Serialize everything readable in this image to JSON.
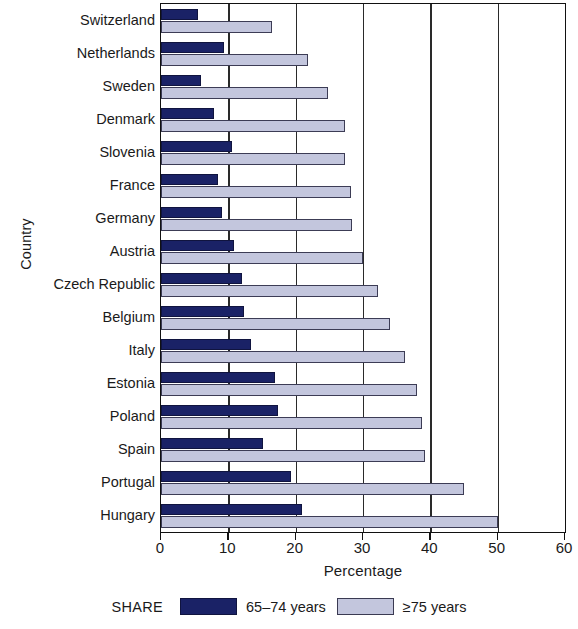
{
  "chart_data": {
    "type": "bar",
    "orientation": "horizontal",
    "title": "",
    "xlabel": "Percentage",
    "ylabel": "Country",
    "xlim": [
      0,
      60
    ],
    "xticks": [
      0,
      10,
      20,
      30,
      40,
      50,
      60
    ],
    "grid": "vertical",
    "legend_position": "bottom",
    "legend_prefix": "SHARE",
    "categories": [
      "Switzerland",
      "Netherlands",
      "Sweden",
      "Denmark",
      "Slovenia",
      "France",
      "Germany",
      "Austria",
      "Czech Republic",
      "Belgium",
      "Italy",
      "Estonia",
      "Poland",
      "Spain",
      "Portugal",
      "Hungary"
    ],
    "series": [
      {
        "name": "65–74 years",
        "color": "#1a2266",
        "values": [
          5.5,
          9.3,
          6.0,
          7.8,
          10.5,
          8.4,
          9.0,
          10.8,
          12.0,
          12.4,
          13.3,
          17.0,
          17.4,
          15.2,
          19.3,
          21.0
        ]
      },
      {
        "name": "≥75 years",
        "color": "#c3c6dd",
        "values": [
          16.5,
          21.8,
          24.8,
          27.4,
          27.3,
          28.2,
          28.3,
          30.0,
          32.3,
          34.0,
          36.3,
          38.0,
          38.8,
          39.2,
          45.0,
          50.0
        ]
      }
    ]
  }
}
